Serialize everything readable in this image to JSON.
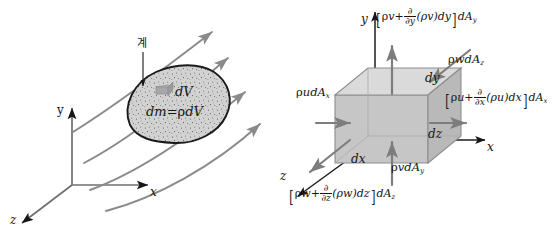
{
  "figure": {
    "background_color": "#ffffff",
    "ink_color": "#161616",
    "streamline_color": "#8a8a8a",
    "arrow_color": "#8a8a8a",
    "fill_color": "#cfcfcf",
    "cube_front_color": "#c9c9c9",
    "cube_top_color": "#d8d8d8",
    "cube_side_color": "#bdbdbd"
  },
  "left_panel": {
    "name": "system-in-flow-field",
    "axes": {
      "y_label": "y",
      "x_label": "x",
      "z_label": "z"
    },
    "callout": {
      "text": "계",
      "meaning": "system"
    },
    "blob_labels": {
      "dV": "dV",
      "dm": "dm=",
      "dm_rho": "ρ",
      "dm_dV": "dV"
    },
    "streamline_count": 4
  },
  "right_panel": {
    "name": "differential-control-volume",
    "axes": {
      "y_label": "y",
      "x_label": "x",
      "z_label": "z"
    },
    "edge_labels": {
      "dx": "dx",
      "dy": "dy",
      "dz": "dz"
    },
    "flux_in": {
      "x_face": {
        "rho": "ρ",
        "vel": "u",
        "area": "dA",
        "area_sub": "x",
        "full": "ρudAx"
      },
      "y_face": {
        "rho": "ρ",
        "vel": "v",
        "area": "dA",
        "area_sub": "y",
        "full": "ρvdAy"
      },
      "z_face": {
        "rho": "ρ",
        "vel": "w",
        "area": "dA",
        "area_sub": "z",
        "full": "ρwdAz"
      }
    },
    "flux_out": {
      "y_face": {
        "open": "[",
        "term1_rho": "ρ",
        "term1_vel": "v",
        "plus": "+",
        "d_num": "∂",
        "d_den": "∂y",
        "group": "(ρv)dy",
        "close": "]",
        "area": "dA",
        "area_sub": "y",
        "full": "[ρv + ∂/∂y (ρv)dy]dAy"
      },
      "x_face": {
        "open": "[",
        "term1_rho": "ρ",
        "term1_vel": "u",
        "plus": "+",
        "d_num": "∂",
        "d_den": "∂x",
        "group": "(ρu)dx",
        "close": "]",
        "area": "dA",
        "area_sub": "x",
        "full": "[ρu + ∂/∂x (ρu)dx]dAx"
      },
      "z_face": {
        "open": "[",
        "term1_rho": "ρ",
        "term1_vel": "w",
        "plus": "+",
        "d_num": "∂",
        "d_den": "∂z",
        "group": "(ρw)dz",
        "close": "]",
        "area": "dA",
        "area_sub": "z",
        "full": "[ρw + ∂/∂z (ρw)dz]dAz"
      }
    }
  }
}
